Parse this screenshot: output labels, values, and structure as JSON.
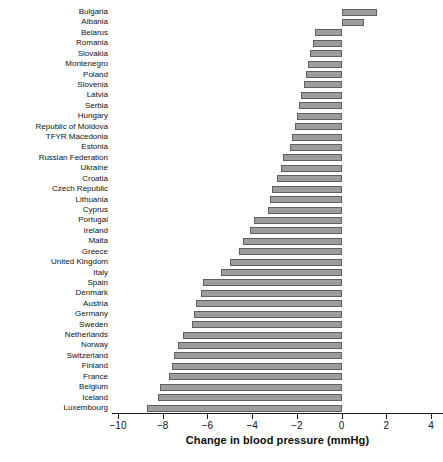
{
  "chart_data": {
    "type": "bar",
    "orientation": "horizontal",
    "title": "",
    "xlabel": "Change in blood pressure (mmHg)",
    "ylabel": "",
    "xlim": [
      -10,
      4
    ],
    "xticks": [
      -10,
      -8,
      -6,
      -4,
      -2,
      0,
      2,
      4
    ],
    "xticklabels": [
      "-10",
      "-8",
      "-6",
      "-4",
      "-2",
      "0",
      "2",
      "4"
    ],
    "grid": false,
    "legend": null,
    "bar_color": "#9d9d9d",
    "bar_edge_color": "#5f5f5f",
    "axis_color": "#1a1a1a",
    "categories": [
      "Bulgaria",
      "Albania",
      "Belarus",
      "Romania",
      "Slovakia",
      "Montenegro",
      "Poland",
      "Slovenia",
      "Latvia",
      "Serbia",
      "Hungary",
      "Republic of Moldova",
      "TFYR Macedonia",
      "Estonia",
      "Russian Federation",
      "Ukraine",
      "Croatia",
      "Czech Republic",
      "Lithuania",
      "Cyprus",
      "Portugal",
      "Ireland",
      "Malta",
      "Greece",
      "United Kingdom",
      "Italy",
      "Spain",
      "Denmark",
      "Austria",
      "Germany",
      "Sweden",
      "Netherlands",
      "Norway",
      "Switzerland",
      "Finland",
      "France",
      "Belgium",
      "Iceland",
      "Luxembourg"
    ],
    "values": [
      1.6,
      1.0,
      -1.2,
      -1.3,
      -1.4,
      -1.5,
      -1.6,
      -1.7,
      -1.8,
      -1.9,
      -2.0,
      -2.1,
      -2.2,
      -2.3,
      -2.6,
      -2.7,
      -2.9,
      -3.1,
      -3.2,
      -3.3,
      -3.9,
      -4.1,
      -4.4,
      -4.6,
      -5.0,
      -5.4,
      -6.2,
      -6.3,
      -6.5,
      -6.6,
      -6.7,
      -7.1,
      -7.3,
      -7.5,
      -7.6,
      -7.7,
      -8.1,
      -8.2,
      -8.7
    ]
  }
}
